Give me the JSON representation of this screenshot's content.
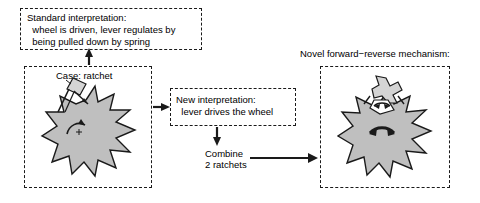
{
  "diagram": {
    "title_semantics": "ratchet reinterpretation and novel forward-reverse mechanism diagram",
    "boxes": {
      "standard_interpretation": {
        "line1": "Standard interpretation:",
        "line2": "  wheel is driven, lever regulates by",
        "line3": "  being pulled down by spring"
      },
      "case_ratchet": {
        "label": "Case: ratchet"
      },
      "new_interpretation": {
        "line1": "New interpretation:",
        "line2": "  lever drives the wheel"
      },
      "novel_mechanism": {
        "heading": "Novel forward−reverse mechanism:"
      }
    },
    "labels": {
      "combine_line1": "Combine",
      "combine_line2": "2 ratchets"
    },
    "icons": {
      "left_gear": "ratchet-wheel-icon",
      "left_pawl": "pawl-lever-icon",
      "left_rotation": "counterclockwise-rotation-arrow-icon",
      "right_gear": "ratchet-wheel-icon",
      "right_pawl": "double-pawl-lever-icon",
      "right_rotation": "bidirectional-rotation-arrow-icon",
      "arrow_up": "arrow-up-icon",
      "arrow_right_case_to_new": "arrow-right-icon",
      "arrow_down_new_to_combine": "arrow-down-icon",
      "arrow_right_combine_to_novel": "arrow-right-icon"
    },
    "colors": {
      "gear_fill": "#bfbfbf",
      "stroke": "#1a1a1a",
      "background": "#ffffff",
      "text": "#000000"
    }
  }
}
